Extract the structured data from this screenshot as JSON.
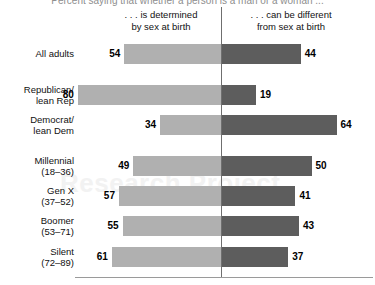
{
  "chart_data": {
    "type": "bar",
    "title": "Percent saying that whether a person is a man or a woman ...",
    "subtitle": "",
    "xlabel": "",
    "ylabel": "",
    "orientation": "horizontal",
    "layout": "diverging-paired",
    "grid": false,
    "legend_position": "top",
    "xlim": [
      0,
      100
    ],
    "categories": [
      "All adults",
      "Republican/ lean Rep",
      "Democrat/ lean Dem",
      "Millennial (18–36)",
      "Gen X (37–52)",
      "Boomer (53–71)",
      "Silent (72–89)"
    ],
    "series": [
      {
        "name": "... is determined by sex at birth",
        "color": "#b0b0b0",
        "values": [
          54,
          80,
          34,
          49,
          57,
          55,
          61
        ]
      },
      {
        "name": "... can be different from sex at birth",
        "color": "#5d5d5d",
        "values": [
          44,
          19,
          64,
          50,
          41,
          43,
          37
        ]
      }
    ]
  },
  "headers": {
    "left": {
      "line1": ". . . is determined",
      "line2": "by sex at birth"
    },
    "right": {
      "line1": ". . . can be different",
      "line2": "from sex at birth"
    }
  },
  "rows": [
    {
      "label_line1": "All adults",
      "label_line2": "",
      "left_value": "54",
      "right_value": "44"
    },
    {
      "label_line1": "Republican/",
      "label_line2": "lean Rep",
      "left_value": "80",
      "right_value": "19"
    },
    {
      "label_line1": "Democrat/",
      "label_line2": "lean Dem",
      "left_value": "34",
      "right_value": "64"
    },
    {
      "label_line1": "Millennial",
      "label_line2": "(18–36)",
      "left_value": "49",
      "right_value": "50"
    },
    {
      "label_line1": "Gen X",
      "label_line2": "(37–52)",
      "left_value": "57",
      "right_value": "41"
    },
    {
      "label_line1": "Boomer",
      "label_line2": "(53–71)",
      "left_value": "55",
      "right_value": "43"
    },
    {
      "label_line1": "Silent",
      "label_line2": "(72–89)",
      "left_value": "61",
      "right_value": "37"
    }
  ],
  "watermark": {
    "text": "Research Project"
  },
  "colors": {
    "left_bar": "#b0b0b0",
    "right_bar": "#5d5d5d",
    "axis": "#6f6f6f",
    "baseline": "#9a9a9a",
    "title": "#8e8e8e"
  }
}
